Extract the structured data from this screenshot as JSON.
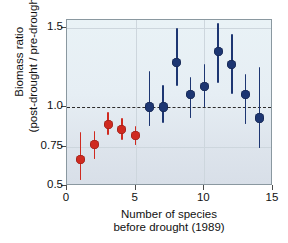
{
  "chart_data": {
    "type": "scatter",
    "title": "",
    "xlabel_line1": "Number of species",
    "xlabel_line2": "before drought (1989)",
    "ylabel_line1": "Biomass ratio",
    "ylabel_line2": "(post-drought / pre-drought)",
    "xlim": [
      0,
      15
    ],
    "ylim": [
      0.5,
      1.55
    ],
    "xticks": [
      0,
      5,
      10,
      15
    ],
    "xtick_labels": [
      "0",
      "5",
      "10",
      "15"
    ],
    "yticks": [
      0.5,
      0.75,
      1.0,
      1.5
    ],
    "ytick_labels": [
      "0.5",
      "0.75",
      "1.0",
      "1.5"
    ],
    "grid": "light-gridlines",
    "legend": "none",
    "reference_line": {
      "y": 1.0,
      "style": "dashed",
      "color": "#2b2b2b"
    },
    "colors": {
      "low_diversity": "#cf2a20",
      "high_diversity": "#1d3672",
      "plot_background": "#e6eef4",
      "frame": "#8a98a0"
    },
    "x": [
      1,
      2,
      3,
      4,
      5,
      6,
      7,
      8,
      9,
      10,
      11,
      12,
      13,
      14
    ],
    "values": [
      0.67,
      0.76,
      0.89,
      0.86,
      0.82,
      1.0,
      1.0,
      1.28,
      1.08,
      1.13,
      1.35,
      1.27,
      1.08,
      0.93
    ],
    "err_low": [
      0.54,
      0.67,
      0.82,
      0.79,
      0.76,
      0.88,
      0.9,
      1.13,
      0.93,
      1.0,
      1.15,
      1.08,
      0.89,
      0.74
    ],
    "err_high": [
      0.84,
      0.85,
      0.97,
      0.93,
      0.88,
      1.23,
      1.14,
      1.5,
      1.19,
      1.27,
      1.53,
      1.46,
      1.21,
      1.25
    ],
    "series": [
      {
        "name": "low diversity",
        "color": "#cf2a20",
        "x": [
          1,
          2,
          3,
          4,
          5
        ],
        "values": [
          0.67,
          0.76,
          0.89,
          0.86,
          0.82
        ]
      },
      {
        "name": "high diversity",
        "color": "#1d3672",
        "x": [
          6,
          7,
          8,
          9,
          10,
          11,
          12,
          13,
          14
        ],
        "values": [
          1.0,
          1.0,
          1.28,
          1.08,
          1.13,
          1.35,
          1.27,
          1.08,
          0.93
        ]
      }
    ]
  }
}
